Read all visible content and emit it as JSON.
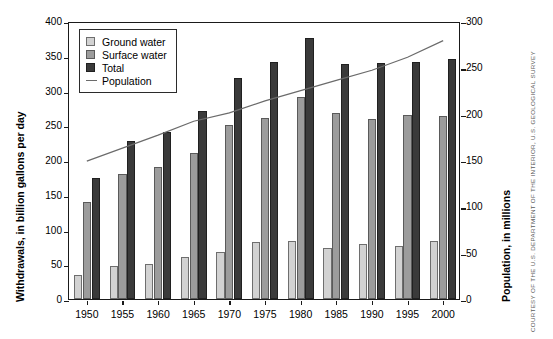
{
  "chart_data": {
    "type": "bar",
    "title": "",
    "subtitle": "",
    "categories": [
      "1950",
      "1955",
      "1960",
      "1965",
      "1970",
      "1975",
      "1980",
      "1985",
      "1990",
      "1995",
      "2000"
    ],
    "series": [
      {
        "name": "Ground water",
        "axis": "left",
        "color": "#d2d2d2",
        "values": [
          34,
          47,
          50,
          60,
          67,
          82,
          83,
          73,
          79,
          77,
          83
        ]
      },
      {
        "name": "Surface water",
        "axis": "left",
        "color": "#9c9c9c",
        "values": [
          140,
          180,
          190,
          210,
          250,
          260,
          290,
          267,
          259,
          265,
          264
        ]
      },
      {
        "name": "Total",
        "axis": "left",
        "color": "#3a3a3a",
        "values": [
          174,
          227,
          241,
          270,
          318,
          341,
          375,
          338,
          339,
          341,
          346
        ]
      },
      {
        "name": "Population",
        "axis": "right",
        "color": "#6b6b6b",
        "type": "line",
        "values": [
          151,
          165,
          179,
          194,
          203,
          216,
          227,
          238,
          249,
          263,
          281
        ]
      }
    ],
    "xlabel": "",
    "ylabel": "Withdrawals, in billion gallons per day",
    "y2label": "Population, in millions",
    "ylim": [
      0,
      400
    ],
    "y2lim": [
      0,
      300
    ],
    "yticks": [
      0,
      50,
      100,
      150,
      200,
      250,
      300,
      350,
      400
    ],
    "y2ticks": [
      0,
      50,
      100,
      150,
      200,
      250,
      300
    ],
    "grid": false,
    "legend_position": "top-left"
  },
  "legend": {
    "items": [
      {
        "label": "Ground water",
        "marker": "gw"
      },
      {
        "label": "Surface water",
        "marker": "sw"
      },
      {
        "label": "Total",
        "marker": "tt"
      },
      {
        "label": "Population",
        "marker": "line"
      }
    ]
  },
  "axes": {
    "left_title": "Withdrawals, in billion gallons per day",
    "right_title": "Population, in millions"
  },
  "credit": {
    "text": "COURTESY OF THE U.S. DEPARTMENT OF THE INTERIOR, U.S. GEOLOGICAL SURVEY"
  }
}
